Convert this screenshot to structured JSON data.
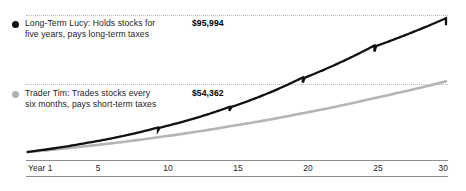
{
  "chart_data": {
    "type": "line",
    "title": "",
    "subtitle": "",
    "xlabel": "",
    "ylabel": "",
    "grid": true,
    "gridlines": [
      {
        "label": "$95,994",
        "value": 95994
      },
      {
        "label": "$54,362",
        "value": 54362
      }
    ],
    "xlim": [
      1,
      30
    ],
    "ylim": [
      10000,
      95994
    ],
    "x_tick_labels": [
      "Year 1",
      "5",
      "10",
      "15",
      "20",
      "25",
      "30"
    ],
    "x_tick_values": [
      1,
      5,
      10,
      15,
      20,
      25,
      30
    ],
    "legend_position": "inside-left",
    "series": [
      {
        "name": "Long-Term Lucy",
        "description_line1": "Long-Term Lucy: Holds stocks for",
        "description_line2": "five years, pays long-term taxes",
        "end_value_label": "$95,994",
        "end_value": 95994,
        "color": "#111111",
        "marker": "filled-circle",
        "style": "sawtooth",
        "note": "Value drops slightly every five years when long-term taxes are paid",
        "x": [
          1,
          5,
          10,
          15,
          20,
          25,
          30
        ],
        "values": [
          10000,
          15500,
          25200,
          38600,
          57200,
          78000,
          95994
        ]
      },
      {
        "name": "Trader Tim",
        "description_line1": "Trader Tim: Trades stocks every",
        "description_line2": "six months, pays short-term taxes",
        "end_value_label": "$54,362",
        "end_value": 54362,
        "color": "#b5b5b5",
        "marker": "filled-circle",
        "style": "smooth",
        "note": "Smooth growth reduced by frequent short-term tax payments",
        "x": [
          1,
          5,
          10,
          15,
          20,
          25,
          30
        ],
        "values": [
          10000,
          13600,
          19200,
          26100,
          34200,
          43800,
          54362
        ]
      }
    ]
  },
  "axis": {
    "tick_0": "Year 1",
    "tick_1": "5",
    "tick_2": "10",
    "tick_3": "15",
    "tick_4": "20",
    "tick_5": "25",
    "tick_6": "30"
  },
  "legend": {
    "lucy": {
      "line1": "Long-Term Lucy: Holds stocks for",
      "line2": "five years, pays long-term taxes",
      "value": "$95,994"
    },
    "tim": {
      "line1": "Trader Tim: Trades stocks every",
      "line2": "six months, pays short-term taxes",
      "value": "$54,362"
    }
  },
  "colors": {
    "series_lucy": "#111111",
    "series_tim": "#b5b5b5",
    "gridline": "#b9b9b9",
    "axis": "#8d8d8d",
    "text": "#1c1c1c",
    "background": "#ffffff"
  }
}
